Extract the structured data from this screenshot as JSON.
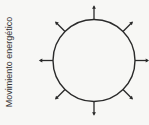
{
  "diagram": {
    "label": "Movimiento energético",
    "arrow_directions": [
      "up",
      "up-right",
      "right",
      "down-right",
      "down",
      "down-left",
      "left",
      "up-left"
    ],
    "arrow_count": 8,
    "colors": {
      "stroke": "#2a2a2a",
      "background": "#f7f7f5",
      "text": "#333333"
    }
  }
}
